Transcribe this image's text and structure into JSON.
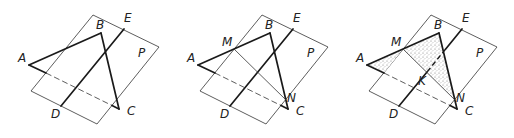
{
  "figure": {
    "panels": [
      {
        "id": "panel-1",
        "offset_x": 0,
        "labels": {
          "A": "A",
          "B": "B",
          "C": "C",
          "D": "D",
          "E": "E",
          "P": "P"
        }
      },
      {
        "id": "panel-2",
        "offset_x": 169,
        "labels": {
          "A": "A",
          "B": "B",
          "C": "C",
          "D": "D",
          "E": "E",
          "P": "P",
          "M": "M",
          "N": "N"
        }
      },
      {
        "id": "panel-3",
        "offset_x": 338,
        "labels": {
          "A": "A",
          "B": "B",
          "C": "C",
          "D": "D",
          "E": "E",
          "P": "P",
          "M": "M",
          "N": "N",
          "K": "K"
        }
      }
    ],
    "geometry": {
      "plane_P": [
        [
          93,
          15
        ],
        [
          159,
          47
        ],
        [
          97,
          124
        ],
        [
          31,
          91
        ]
      ],
      "A": [
        29,
        65
      ],
      "B": [
        101,
        33
      ],
      "C": [
        119,
        109
      ],
      "D": [
        61,
        106
      ],
      "E": [
        124,
        29
      ],
      "M": [
        65,
        49
      ],
      "N": [
        117,
        100
      ],
      "K": [
        89,
        72
      ]
    },
    "colors": {
      "line": "#1a1a1a",
      "thin": "#333333",
      "shade": "#d9d9d9"
    }
  }
}
